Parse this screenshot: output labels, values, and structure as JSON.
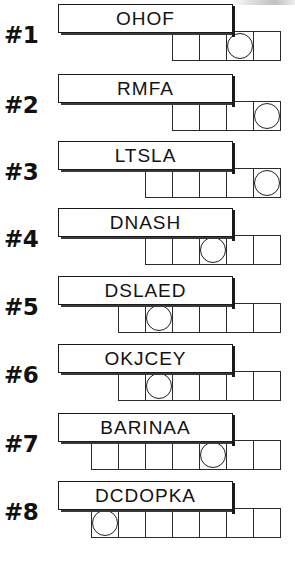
{
  "sheet": {
    "title": "Word Unscramble Worksheet",
    "row_count": 8
  },
  "rows": [
    {
      "number": "#1",
      "word": "OHOF",
      "cell_count": 4,
      "circle_index": 3,
      "grid_left": 172
    },
    {
      "number": "#2",
      "word": "RMFA",
      "cell_count": 4,
      "circle_index": 4,
      "grid_left": 172
    },
    {
      "number": "#3",
      "word": "LTSLA",
      "cell_count": 5,
      "circle_index": 5,
      "grid_left": 145
    },
    {
      "number": "#4",
      "word": "DNASH",
      "cell_count": 5,
      "circle_index": 3,
      "grid_left": 145
    },
    {
      "number": "#5",
      "word": "DSLAED",
      "cell_count": 6,
      "circle_index": 2,
      "grid_left": 118
    },
    {
      "number": "#6",
      "word": "OKJCEY",
      "cell_count": 6,
      "circle_index": 2,
      "grid_left": 118
    },
    {
      "number": "#7",
      "word": "BARINAA",
      "cell_count": 7,
      "circle_index": 5,
      "grid_left": 91
    },
    {
      "number": "#8",
      "word": "DCDOPKA",
      "cell_count": 7,
      "circle_index": 1,
      "grid_left": 91
    }
  ]
}
